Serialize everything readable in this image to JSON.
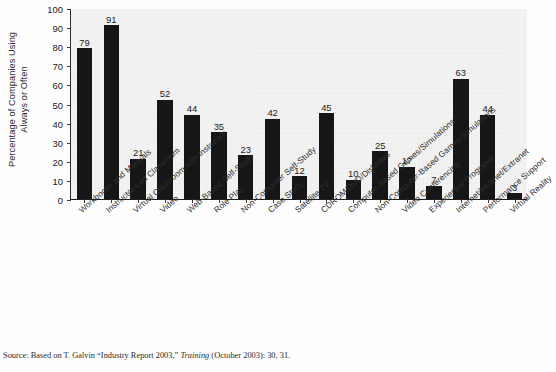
{
  "chart_data": {
    "type": "bar",
    "title": "",
    "subtitle": "",
    "xlabel": "",
    "ylabel": "Percentage of Companies Using Always or Often",
    "ylabel_lines": [
      "Percentage of Companies Using",
      "Always or Often"
    ],
    "ylim": [
      0,
      100
    ],
    "ytick_step": 10,
    "yticks": [
      0,
      10,
      20,
      30,
      40,
      50,
      60,
      70,
      80,
      90,
      100
    ],
    "grid": false,
    "legend": null,
    "bar_color": "#161616",
    "plot_bg": "#f2f2f2",
    "categories": [
      "Workbooks and Manuals",
      "Instructor-Led Classroom",
      "Virtual Classroom with Instructor",
      "Video",
      "Web-Based Self-Study",
      "Role Play",
      "Non-Computer Self-Study",
      "Case Study",
      "Satellite TV",
      "CDROM/DVD/Diskettes",
      "Computer-Based Games/Simulations",
      "Non-Computer-Based Games/Simulations",
      "Video Conferencing",
      "Experiential Programs",
      "Internet/Intranet/Extranet",
      "Performance Support",
      "Virtual Reality"
    ],
    "values": [
      79,
      91,
      21,
      52,
      44,
      35,
      23,
      42,
      12,
      45,
      10,
      25,
      17,
      7,
      63,
      44,
      3
    ],
    "data_labels": [
      "79",
      "91",
      "21",
      "52",
      "44",
      "35",
      "23",
      "42",
      "12",
      "45",
      "10",
      "25",
      "17",
      "7",
      "63",
      "44",
      "3"
    ]
  },
  "source": {
    "prefix": "Source: Based on T. Galvin “Industry Report 2003,” ",
    "italic": "Training",
    "suffix": " (October 2003): 30, 31."
  }
}
